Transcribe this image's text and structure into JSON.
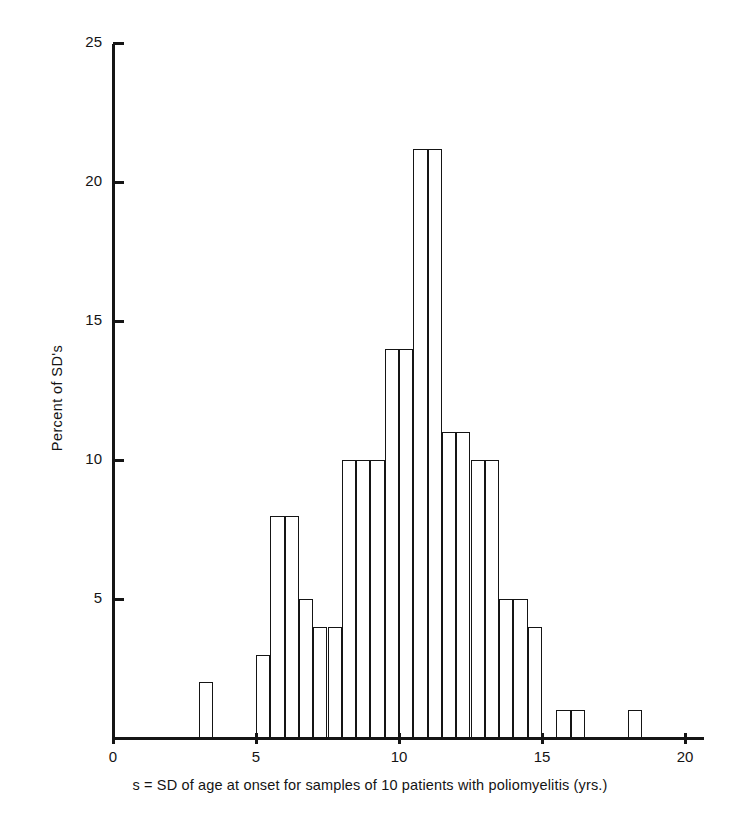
{
  "figure": {
    "background_color": "#ffffff",
    "ink_color": "#151515"
  },
  "axes": {
    "y": {
      "label": "Percent of SD's",
      "ticks": [
        {
          "value": 5,
          "label": "5"
        },
        {
          "value": 10,
          "label": "10"
        },
        {
          "value": 15,
          "label": "15"
        },
        {
          "value": 20,
          "label": "20"
        },
        {
          "value": 25,
          "label": "25"
        }
      ],
      "min": 0,
      "max": 25
    },
    "x": {
      "label": "s = SD of age at onset for samples of 10 patients with poliomyelitis (yrs.)",
      "ticks": [
        {
          "value": 0,
          "label": "0"
        },
        {
          "value": 5,
          "label": "5"
        },
        {
          "value": 10,
          "label": "10"
        },
        {
          "value": 15,
          "label": "15"
        },
        {
          "value": 20,
          "label": "20"
        }
      ],
      "min": 0,
      "max": 20.7
    }
  },
  "chart_data": {
    "type": "bar",
    "title": "",
    "subtitle": "",
    "xlabel": "s = SD of age at onset for samples of 10 patients with poliomyelitis (yrs.)",
    "ylabel": "Percent of SD's",
    "xlim": [
      0,
      20.7
    ],
    "ylim": [
      0,
      25
    ],
    "grid": false,
    "legend": "none",
    "bin_width": 0.5,
    "categories": [
      "3.0-3.5",
      "3.5-4.0",
      "4.0-4.5",
      "4.5-5.0",
      "5.0-5.5",
      "5.5-6.0",
      "6.0-6.5",
      "6.5-7.0",
      "7.0-7.5",
      "7.5-8.0",
      "8.0-8.5",
      "8.5-9.0",
      "9.0-9.5",
      "9.5-10.0",
      "10.0-10.5",
      "10.5-11.0",
      "11.0-11.5",
      "11.5-12.0",
      "12.0-12.5",
      "12.5-13.0",
      "13.0-13.5",
      "13.5-14.0",
      "14.0-14.5",
      "14.5-15.0",
      "15.0-15.5",
      "15.5-16.0",
      "16.0-16.5",
      "16.5-17.0",
      "17.0-17.5",
      "17.5-18.0",
      "18.0-18.5",
      "18.5-19.0",
      "19.0-19.5",
      "19.5-20.0",
      "20.0-20.5"
    ],
    "bins": [
      {
        "x0": 3.0,
        "x1": 3.5,
        "value": 2
      },
      {
        "x0": 3.5,
        "x1": 4.0,
        "value": 0
      },
      {
        "x0": 4.0,
        "x1": 4.5,
        "value": 0
      },
      {
        "x0": 4.5,
        "x1": 5.0,
        "value": 0
      },
      {
        "x0": 5.0,
        "x1": 5.5,
        "value": 3
      },
      {
        "x0": 5.5,
        "x1": 6.0,
        "value": 3
      },
      {
        "x0": 6.0,
        "x1": 6.5,
        "value": 8
      },
      {
        "x0": 6.5,
        "x1": 7.0,
        "value": 8
      },
      {
        "x0": 7.0,
        "x1": 7.5,
        "value": 5
      },
      {
        "x0": 7.5,
        "x1": 8.0,
        "value": 5
      },
      {
        "x0": 8.0,
        "x1": 8.5,
        "value": 4
      },
      {
        "x0": 8.5,
        "x1": 9.0,
        "value": 4
      },
      {
        "x0": 9.0,
        "x1": 9.5,
        "value": 10
      },
      {
        "x0": 9.5,
        "x1": 10.0,
        "value": 10
      },
      {
        "x0": 10.0,
        "x1": 10.5,
        "value": 14
      },
      {
        "x0": 10.5,
        "x1": 11.0,
        "value": 14
      },
      {
        "x0": 11.0,
        "x1": 11.5,
        "value": 21.2
      },
      {
        "x0": 11.5,
        "x1": 12.0,
        "value": 21.2
      },
      {
        "x0": 12.0,
        "x1": 12.5,
        "value": 11
      },
      {
        "x0": 12.5,
        "x1": 13.0,
        "value": 11
      },
      {
        "x0": 13.0,
        "x1": 13.5,
        "value": 10
      },
      {
        "x0": 13.5,
        "x1": 14.0,
        "value": 10
      },
      {
        "x0": 14.0,
        "x1": 14.5,
        "value": 5
      },
      {
        "x0": 14.5,
        "x1": 15.0,
        "value": 5
      },
      {
        "x0": 15.0,
        "x1": 15.5,
        "value": 4
      },
      {
        "x0": 15.5,
        "x1": 16.0,
        "value": 0
      },
      {
        "x0": 16.0,
        "x1": 16.5,
        "value": 1
      },
      {
        "x0": 16.5,
        "x1": 17.0,
        "value": 1
      },
      {
        "x0": 17.0,
        "x1": 17.5,
        "value": 1
      },
      {
        "x0": 17.5,
        "x1": 18.0,
        "value": 0
      },
      {
        "x0": 18.0,
        "x1": 18.5,
        "value": 0
      },
      {
        "x0": 18.5,
        "x1": 19.0,
        "value": 0
      },
      {
        "x0": 19.0,
        "x1": 19.5,
        "value": 0
      },
      {
        "x0": 19.5,
        "x1": 20.0,
        "value": 0
      },
      {
        "x0": 20.0,
        "x1": 20.5,
        "value": 1
      }
    ],
    "drawn_bars": [
      {
        "x0": 3.0,
        "x1": 3.5,
        "value": 2
      },
      {
        "x0": 5.0,
        "x1": 5.5,
        "value": 3
      },
      {
        "x0": 5.5,
        "x1": 6.0,
        "value": 8
      },
      {
        "x0": 6.0,
        "x1": 6.5,
        "value": 8
      },
      {
        "x0": 6.5,
        "x1": 7.0,
        "value": 5
      },
      {
        "x0": 7.0,
        "x1": 7.5,
        "value": 4
      },
      {
        "x0": 7.5,
        "x1": 8.0,
        "value": 4
      },
      {
        "x0": 8.0,
        "x1": 8.5,
        "value": 10
      },
      {
        "x0": 8.5,
        "x1": 9.0,
        "value": 10
      },
      {
        "x0": 9.0,
        "x1": 9.5,
        "value": 10
      },
      {
        "x0": 9.5,
        "x1": 10.0,
        "value": 14
      },
      {
        "x0": 10.0,
        "x1": 10.5,
        "value": 14
      },
      {
        "x0": 10.5,
        "x1": 11.0,
        "value": 21.2
      },
      {
        "x0": 11.0,
        "x1": 11.5,
        "value": 21.2
      },
      {
        "x0": 11.5,
        "x1": 12.0,
        "value": 11
      },
      {
        "x0": 12.0,
        "x1": 12.5,
        "value": 11
      },
      {
        "x0": 12.5,
        "x1": 13.0,
        "value": 10
      },
      {
        "x0": 13.0,
        "x1": 13.5,
        "value": 10
      },
      {
        "x0": 13.5,
        "x1": 14.0,
        "value": 5
      },
      {
        "x0": 14.0,
        "x1": 14.5,
        "value": 5
      },
      {
        "x0": 14.5,
        "x1": 15.0,
        "value": 4
      },
      {
        "x0": 15.5,
        "x1": 16.0,
        "value": 1
      },
      {
        "x0": 16.0,
        "x1": 16.5,
        "value": 1
      },
      {
        "x0": 18.0,
        "x1": 18.5,
        "value": 1
      }
    ]
  }
}
